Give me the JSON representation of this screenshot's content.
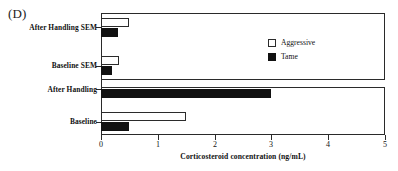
{
  "panel": {
    "label": "(D)"
  },
  "chart_data": {
    "type": "bar",
    "orientation": "horizontal",
    "title": "",
    "xlabel": "Corticosteroid concentration (ng/mL)",
    "ylabel": "",
    "xlim": [
      0,
      5
    ],
    "xticks": [
      "0",
      "1",
      "2",
      "3",
      "4",
      "5"
    ],
    "grid": false,
    "legend_position": "upper-right-inside",
    "categories": [
      "Baseline",
      "After Handling",
      "Baseline SEM",
      "After Handling SEM"
    ],
    "series": [
      {
        "name": "Aggressive",
        "color": "#ffffff",
        "edge_color": "#2b2b2b",
        "values": [
          1.5,
          5.2,
          0.32,
          0.5
        ]
      },
      {
        "name": "Tame",
        "color": "#111111",
        "edge_color": "#111111",
        "values": [
          0.5,
          3.0,
          0.2,
          0.3
        ]
      }
    ]
  },
  "legend": {
    "items": [
      {
        "label": "Aggressive",
        "swatch": "open-square-icon"
      },
      {
        "label": "Tame",
        "swatch": "filled-square-icon"
      }
    ]
  },
  "axis": {
    "tick_labels": [
      "0",
      "1",
      "2",
      "3",
      "4",
      "5"
    ],
    "title": "Corticosteroid concentration (ng/mL)"
  },
  "category_labels": [
    "After Handling SEM",
    "Baseline SEM",
    "After Handling",
    "Baseline"
  ]
}
